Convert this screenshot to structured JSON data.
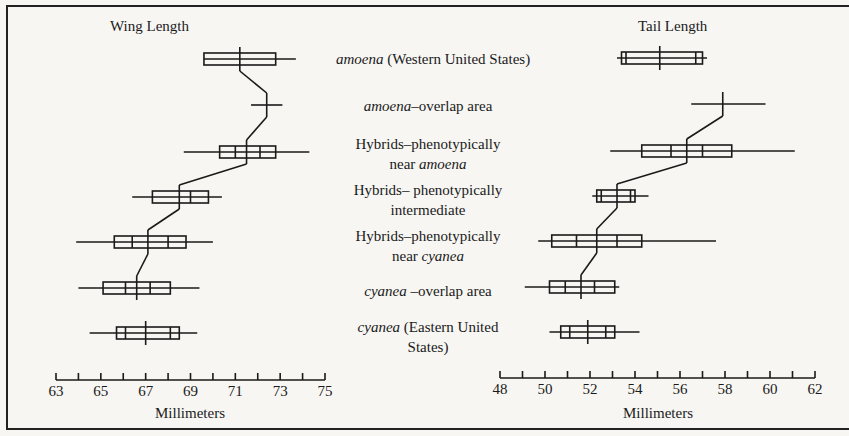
{
  "chart_data": [
    {
      "type": "box",
      "title": "Wing Length",
      "xlabel": "Millimeters",
      "xlim": [
        63,
        75
      ],
      "xticks": [
        63,
        64,
        65,
        66,
        67,
        68,
        69,
        70,
        71,
        72,
        73,
        74,
        75
      ],
      "xtick_labels": [
        "63",
        "65",
        "67",
        "69",
        "71",
        "73",
        "75"
      ],
      "categories": [
        "amoena (Western United States)",
        "amoena–overlap area",
        "Hybrids–phenotypically near amoena",
        "Hybrids–phenotypically intermediate",
        "Hybrids–phenotypically near cyanea",
        "cyanea–overlap area",
        "cyanea (Eastern United States)"
      ],
      "series": [
        {
          "name": "amoena (Western United States)",
          "min": 69.6,
          "max": 73.7,
          "box": [
            69.6,
            72.8
          ],
          "inner": [],
          "mean": 71.2
        },
        {
          "name": "amoena–overlap area",
          "min": 71.7,
          "max": 73.1,
          "box": null,
          "inner": [],
          "mean": 72.4
        },
        {
          "name": "Hybrids–phenotypically near amoena",
          "min": 68.7,
          "max": 74.3,
          "box": [
            70.3,
            72.8
          ],
          "inner": [
            71.0,
            72.1
          ],
          "mean": 71.5
        },
        {
          "name": "Hybrids–phenotypically intermediate",
          "min": 66.4,
          "max": 70.4,
          "box": [
            67.3,
            69.8
          ],
          "inner": [
            69.0
          ],
          "mean": 68.5
        },
        {
          "name": "Hybrids–phenotypically near cyanea",
          "min": 63.9,
          "max": 70.0,
          "box": [
            65.6,
            68.8
          ],
          "inner": [
            66.4,
            68.0
          ],
          "mean": 67.1
        },
        {
          "name": "cyanea–overlap area",
          "min": 64.0,
          "max": 69.4,
          "box": [
            65.1,
            68.1
          ],
          "inner": [
            66.1,
            67.2
          ],
          "mean": 66.6
        },
        {
          "name": "cyanea (Eastern United States)",
          "min": 64.5,
          "max": 69.3,
          "box": [
            65.7,
            68.5
          ],
          "inner": [
            66.1,
            68.1
          ],
          "mean": 67.0
        }
      ]
    },
    {
      "type": "box",
      "title": "Tail Length",
      "xlabel": "Millimeters",
      "xlim": [
        48,
        62
      ],
      "xticks": [
        48,
        49,
        50,
        51,
        52,
        53,
        54,
        55,
        56,
        57,
        58,
        59,
        60,
        61,
        62
      ],
      "xtick_labels": [
        "48",
        "50",
        "52",
        "54",
        "56",
        "58",
        "60",
        "62"
      ],
      "categories": [
        "amoena (Western United States)",
        "amoena–overlap area",
        "Hybrids–phenotypically near amoena",
        "Hybrids–phenotypically intermediate",
        "Hybrids–phenotypically near cyanea",
        "cyanea–overlap area",
        "cyanea (Eastern United States)"
      ],
      "series": [
        {
          "name": "amoena (Western United States)",
          "min": 53.2,
          "max": 57.2,
          "box": [
            53.4,
            57.0
          ],
          "inner": [
            53.6,
            56.7
          ],
          "mean": 55.1
        },
        {
          "name": "amoena–overlap area",
          "min": 56.5,
          "max": 59.8,
          "box": null,
          "inner": [],
          "mean": 57.9
        },
        {
          "name": "Hybrids–phenotypically near amoena",
          "min": 52.9,
          "max": 61.1,
          "box": [
            54.3,
            58.3
          ],
          "inner": [
            55.6,
            57.0
          ],
          "mean": 56.3
        },
        {
          "name": "Hybrids–phenotypically intermediate",
          "min": 52.1,
          "max": 54.6,
          "box": [
            52.3,
            54.0
          ],
          "inner": [
            52.5,
            53.8
          ],
          "mean": 53.2
        },
        {
          "name": "Hybrids–phenotypically near cyanea",
          "min": 49.7,
          "max": 57.6,
          "box": [
            50.3,
            54.3
          ],
          "inner": [
            51.4,
            53.2
          ],
          "mean": 52.3
        },
        {
          "name": "cyanea–overlap area",
          "min": 49.1,
          "max": 53.3,
          "box": [
            50.2,
            53.1
          ],
          "inner": [
            50.9,
            52.2
          ],
          "mean": 51.6
        },
        {
          "name": "cyanea (Eastern United States)",
          "min": 50.2,
          "max": 54.2,
          "box": [
            50.7,
            53.1
          ],
          "inner": [
            51.1,
            52.7
          ],
          "mean": 51.9
        }
      ]
    }
  ],
  "labels": {
    "wing_title": "Wing Length",
    "tail_title": "Tail Length",
    "axis_title": "Millimeters",
    "rows": [
      {
        "line1_italic": "amoena",
        "line1_rest": " (Western United States)",
        "line2_plain": "",
        "line2_italic": ""
      },
      {
        "line1_italic": "amoena",
        "line1_rest": "–overlap area",
        "line2_plain": "",
        "line2_italic": ""
      },
      {
        "line1_italic": "",
        "line1_rest": "Hybrids–phenotypically",
        "line2_plain": "near ",
        "line2_italic": "amoena"
      },
      {
        "line1_italic": "",
        "line1_rest": "Hybrids– phenotypically",
        "line2_plain": "intermediate",
        "line2_italic": ""
      },
      {
        "line1_italic": "",
        "line1_rest": "Hybrids–phenotypically",
        "line2_plain": "near ",
        "line2_italic": "cyanea"
      },
      {
        "line1_italic": "cyanea",
        "line1_rest": " –overlap area",
        "line2_plain": "",
        "line2_italic": ""
      },
      {
        "line1_italic": "cyanea",
        "line1_rest": " (Eastern United",
        "line2_plain": "States)",
        "line2_italic": ""
      }
    ]
  }
}
